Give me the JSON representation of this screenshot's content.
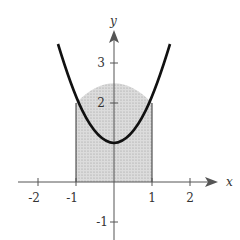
{
  "figure": {
    "function": "y = x^2 + 1",
    "shaded_region": {
      "x_from": -1,
      "x_to": 1,
      "description": "area under curve from x=-1 to x=1"
    },
    "x_axis": {
      "label": "x",
      "ticks": [
        "-2",
        "-1",
        "1",
        "2"
      ]
    },
    "y_axis": {
      "label": "y",
      "ticks": [
        "3",
        "2",
        "-1"
      ]
    },
    "colors": {
      "curve": "#111111",
      "shade": "#d4d4d4",
      "axis": "#555555"
    }
  }
}
